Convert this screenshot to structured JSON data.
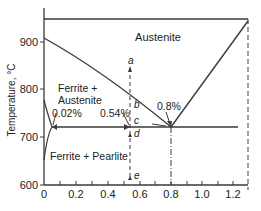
{
  "diagram": {
    "ylabel": "Temperature, °C",
    "y_ticks": [
      "900",
      "800",
      "700",
      "600"
    ],
    "x_ticks": [
      "0",
      "0.2",
      "0.4",
      "0.6",
      "0.8",
      "1.0",
      "1.2"
    ],
    "regions": {
      "austenite": "Austenite",
      "ferrite_austenite_1": "Ferrite +",
      "ferrite_austenite_2": "Austenite",
      "ferrite_pearlite": "Ferrite + Pearlite"
    },
    "annotations": {
      "c_002": "0.02%",
      "c_054": "0.54%",
      "c_08": "0.8%"
    },
    "points": {
      "a": "a",
      "b": "b",
      "c": "c",
      "d": "d",
      "e": "e"
    },
    "colors": {
      "line": "#3a3a3a",
      "text": "#222222"
    }
  }
}
